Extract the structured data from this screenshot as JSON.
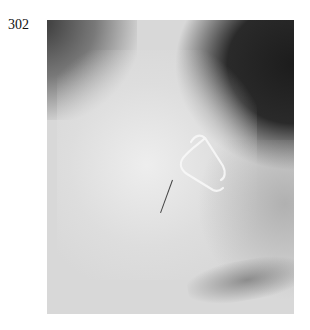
{
  "page": {
    "number": "302"
  },
  "figure": {
    "type": "radiograph",
    "colors": {
      "dark_region": "#1c1c1c",
      "mid_tone": "#bdbdbd",
      "bright_region": "#ececec",
      "clip": "#f5f5f5"
    }
  }
}
